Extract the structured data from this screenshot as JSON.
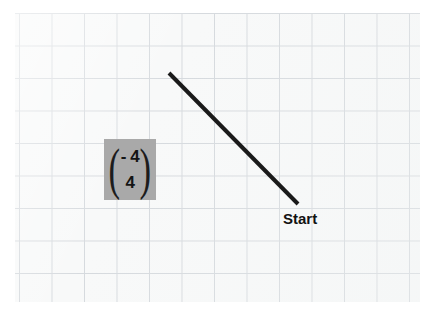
{
  "figure": {
    "type": "grid-vector-diagram",
    "background_color": "#ffffff",
    "grid": {
      "name": "graph-paper",
      "cell_color": "#f8f9f9",
      "line_color": "#d6dade",
      "cell_size_px": 32.5,
      "columns": 12,
      "rows": 9
    },
    "vector_segment": {
      "name": "translation-line",
      "color": "#1a1a1a",
      "stroke_width": 4,
      "x1": 169,
      "y1": 73,
      "x2": 298,
      "y2": 204
    },
    "labels": {
      "start": "Start"
    },
    "vector_notation": {
      "highlight_color": "#a9a9a9",
      "open_paren": "(",
      "close_paren": ")",
      "top_component": "- 4",
      "bottom_component": "4"
    }
  },
  "chart_data": {
    "type": "scatter",
    "title": "",
    "xlabel": "",
    "ylabel": "",
    "grid": true,
    "legend": "none",
    "annotations": [
      "Start",
      "- 4",
      "4"
    ],
    "series": [
      {
        "name": "translation-vector",
        "x": [
          0,
          4
        ],
        "y": [
          4,
          0
        ],
        "label": "(-4, 4)"
      }
    ]
  }
}
